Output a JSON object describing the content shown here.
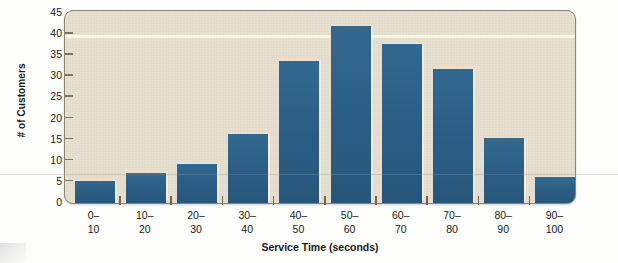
{
  "chart_data": {
    "type": "bar",
    "title": "",
    "xlabel": "Service Time (seconds)",
    "ylabel": "# of Customers",
    "categories": [
      "0–10",
      "10–20",
      "20–30",
      "30–40",
      "40–50",
      "50–60",
      "60–70",
      "70–80",
      "80–90",
      "90–100"
    ],
    "category_lines": [
      {
        "line1": "0–",
        "line2": "10"
      },
      {
        "line1": "10–",
        "line2": "20"
      },
      {
        "line1": "20–",
        "line2": "30"
      },
      {
        "line1": "30–",
        "line2": "40"
      },
      {
        "line1": "40–",
        "line2": "50"
      },
      {
        "line1": "50–",
        "line2": "60"
      },
      {
        "line1": "60–",
        "line2": "70"
      },
      {
        "line1": "70–",
        "line2": "80"
      },
      {
        "line1": "80–",
        "line2": "90"
      },
      {
        "line1": "90–",
        "line2": "100"
      }
    ],
    "values": [
      5,
      7,
      9,
      16,
      33,
      41,
      37,
      31,
      15,
      6
    ],
    "ylim": [
      0,
      45
    ],
    "yticks": [
      0,
      5,
      10,
      15,
      20,
      25,
      30,
      35,
      40,
      45
    ],
    "ytick_labels": [
      "0",
      "5",
      "10",
      "15",
      "20",
      "25",
      "30",
      "35",
      "40",
      "45"
    ],
    "grid": false,
    "legend": null,
    "bar_color": "#2c5f87",
    "plot_background": "#e7dfce",
    "frame_color": "#8d8471"
  }
}
